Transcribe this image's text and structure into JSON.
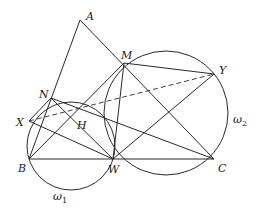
{
  "diagram": {
    "type": "geometry",
    "points": {
      "A": {
        "label": "A",
        "x": 80,
        "y": 20
      },
      "M": {
        "label": "M",
        "x": 124,
        "y": 63
      },
      "Y": {
        "label": "Y",
        "x": 214,
        "y": 74
      },
      "N": {
        "label": "N",
        "x": 51,
        "y": 98
      },
      "X": {
        "label": "X",
        "x": 29,
        "y": 121
      },
      "H": {
        "label": "H",
        "x": 77,
        "y": 118
      },
      "B": {
        "label": "B",
        "x": 29,
        "y": 159
      },
      "W": {
        "label": "W",
        "x": 113,
        "y": 159
      },
      "C": {
        "label": "C",
        "x": 214,
        "y": 159
      }
    },
    "circles": [
      {
        "name": "omega1",
        "label": "ω",
        "subscript": "1",
        "through": [
          "B",
          "X",
          "N",
          "W"
        ]
      },
      {
        "name": "omega2",
        "label": "ω",
        "subscript": "2",
        "through": [
          "M",
          "Y",
          "C",
          "W"
        ]
      }
    ],
    "segments_solid": [
      [
        "A",
        "B"
      ],
      [
        "A",
        "C"
      ],
      [
        "B",
        "C"
      ],
      [
        "M",
        "Y"
      ],
      [
        "M",
        "W"
      ],
      [
        "N",
        "W"
      ],
      [
        "N",
        "C"
      ],
      [
        "X",
        "W"
      ],
      [
        "B",
        "M"
      ],
      [
        "W",
        "Y"
      ],
      [
        "X",
        "N"
      ]
    ],
    "segments_dashed": [
      [
        "X",
        "Y"
      ]
    ]
  }
}
